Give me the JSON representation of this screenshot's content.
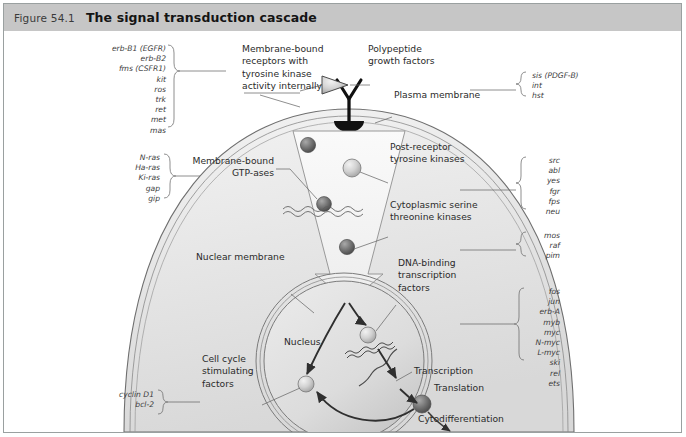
{
  "figure": {
    "number": "Figure 54.1",
    "title": "The signal transduction cascade"
  },
  "gene_lists": {
    "receptor_tyrosine_kinases": {
      "items": [
        "erb-B1 (EGFR)",
        "erb-B2",
        "fms (CSFR1)",
        "kit",
        "ros",
        "trk",
        "ret",
        "met",
        "mas"
      ],
      "text": "erb-B1 (EGFR)\nerb-B2\nfms (CSFR1)\nkit\nros\ntrk\nret\nmet\nmas"
    },
    "gtpases": {
      "items": [
        "N-ras",
        "Ha-ras",
        "Ki-ras",
        "gap",
        "gip"
      ],
      "text": "N-ras\nHa-ras\nKi-ras\ngap\ngip"
    },
    "cell_cycle": {
      "items": [
        "cyclin D1",
        "bcl-2"
      ],
      "text": "cyclin D1\nbcl-2"
    },
    "growth_factors": {
      "items": [
        "sis (PDGF-B)",
        "int",
        "hst"
      ],
      "text": "sis (PDGF-B)\nint\nhst"
    },
    "post_receptor_tyrosine_kinases": {
      "items": [
        "src",
        "abl",
        "yes",
        "fgr",
        "fps",
        "neu"
      ],
      "text": "src\nabl\nyes\nfgr\nfps\nneu"
    },
    "serine_threonine_kinases": {
      "items": [
        "mos",
        "raf",
        "pim"
      ],
      "text": "mos\nraf\npim"
    },
    "transcription_factors": {
      "items": [
        "fos",
        "jun",
        "erb-A",
        "myb",
        "myc",
        "N-myc",
        "L-myc",
        "ski",
        "rel",
        "ets"
      ],
      "text": "fos\njun\nerb-A\nmyb\nmyc\nN-myc\nL-myc\nski\nrel\nets"
    }
  },
  "labels": {
    "membrane_bound_receptors": "Membrane-bound\nreceptors with\ntyrosine kinase\nactivity internally",
    "polypeptide_growth_factors": "Polypeptide\ngrowth factors",
    "plasma_membrane": "Plasma membrane",
    "membrane_bound_gtpases": "Membrane-bound\nGTP-ases",
    "post_receptor_tyrosine_kinases": "Post-receptor\ntyrosine kinases",
    "cytoplasmic_serine_threonine_kinases": "Cytoplasmic serine\nthreonine kinases",
    "nuclear_membrane": "Nuclear membrane",
    "nucleus": "Nucleus",
    "dna_binding_transcription_factors": "DNA-binding\ntranscription\nfactors",
    "transcription": "Transcription",
    "translation": "Translation",
    "cell_cycle_stimulating_factors": "Cell cycle\nstimulating\nfactors",
    "cytodifferentiation": "Cytodifferentiation"
  },
  "colors": {
    "header_background": "#c6c6c6",
    "frame_border": "#9aa0a0",
    "text": "#2b2b2b",
    "gene_text": "#3d3d3d",
    "cytoplasm": "#ececec",
    "nucleus": "#dedede",
    "sphere_dark": "#6d6d6d",
    "sphere_light": "#c9c9c9",
    "receptor": "#111111"
  }
}
